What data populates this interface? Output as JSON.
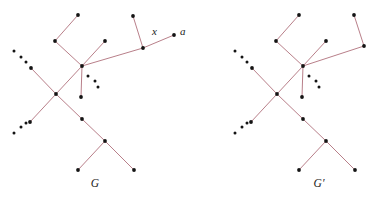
{
  "figure": {
    "width": 384,
    "height": 208,
    "background_color": "#ffffff",
    "edge_color": "#b0707c",
    "edge_width": 0.9,
    "vertex_color": "#141414",
    "vertex_radius": 1.9,
    "ellipsis_dot_color": "#141414",
    "ellipsis_dot_radius": 1.5
  },
  "panels": [
    {
      "id": "graph-g",
      "caption": "G",
      "caption_position": {
        "x": 95,
        "y": 187
      },
      "vertices": [
        {
          "id": "g-top-leaf",
          "x": 78,
          "y": 15
        },
        {
          "id": "g-upper-left-node",
          "x": 55,
          "y": 41
        },
        {
          "id": "g-right-leaf",
          "x": 105,
          "y": 41
        },
        {
          "id": "g-hub",
          "x": 82,
          "y": 66
        },
        {
          "id": "g-hub-pendant",
          "x": 81,
          "y": 97
        },
        {
          "id": "g-left-chain-end",
          "x": 31,
          "y": 68
        },
        {
          "id": "g-cross",
          "x": 56,
          "y": 94
        },
        {
          "id": "g-lower-left-end",
          "x": 30,
          "y": 122
        },
        {
          "id": "g-mid-lower",
          "x": 82,
          "y": 119
        },
        {
          "id": "g-fork",
          "x": 105,
          "y": 141
        },
        {
          "id": "g-fork-left-leaf",
          "x": 78,
          "y": 170
        },
        {
          "id": "g-fork-right-leaf",
          "x": 134,
          "y": 170
        },
        {
          "id": "g-x",
          "x": 143,
          "y": 48
        },
        {
          "id": "g-x-pendant",
          "x": 133,
          "y": 16
        },
        {
          "id": "g-a",
          "x": 174,
          "y": 35
        }
      ],
      "edges": [
        [
          "g-top-leaf",
          "g-upper-left-node"
        ],
        [
          "g-upper-left-node",
          "g-hub"
        ],
        [
          "g-right-leaf",
          "g-hub"
        ],
        [
          "g-hub",
          "g-hub-pendant"
        ],
        [
          "g-hub",
          "g-cross"
        ],
        [
          "g-left-chain-end",
          "g-cross"
        ],
        [
          "g-cross",
          "g-lower-left-end"
        ],
        [
          "g-cross",
          "g-mid-lower"
        ],
        [
          "g-mid-lower",
          "g-fork"
        ],
        [
          "g-fork",
          "g-fork-left-leaf"
        ],
        [
          "g-fork",
          "g-fork-right-leaf"
        ],
        [
          "g-hub",
          "g-x"
        ],
        [
          "g-x",
          "g-x-pendant"
        ],
        [
          "g-x",
          "g-a"
        ]
      ],
      "ellipsis_groups": [
        {
          "id": "g-ellipsis-upper-left",
          "dots": [
            [
              14,
              51
            ],
            [
              21,
              57
            ],
            [
              26,
              62
            ]
          ]
        },
        {
          "id": "g-ellipsis-lower-left",
          "dots": [
            [
              14,
              133
            ],
            [
              21,
              127
            ],
            [
              26,
              123
            ]
          ]
        },
        {
          "id": "g-ellipsis-hub-right",
          "dots": [
            [
              88,
              76
            ],
            [
              95,
              81
            ],
            [
              98,
              87
            ]
          ]
        }
      ],
      "labels": [
        {
          "id": "g-label-x",
          "text": "x",
          "x": 152,
          "y": 35
        },
        {
          "id": "g-label-a",
          "text": "a",
          "x": 180,
          "y": 35
        }
      ]
    },
    {
      "id": "graph-g-prime",
      "caption": "G′",
      "caption_position": {
        "x": 319,
        "y": 187
      },
      "vertices": [
        {
          "id": "p-top-leaf",
          "x": 299,
          "y": 15
        },
        {
          "id": "p-upper-left-node",
          "x": 276,
          "y": 41
        },
        {
          "id": "p-right-leaf",
          "x": 326,
          "y": 41
        },
        {
          "id": "p-hub",
          "x": 303,
          "y": 66
        },
        {
          "id": "p-hub-pendant",
          "x": 302,
          "y": 97
        },
        {
          "id": "p-left-chain-end",
          "x": 252,
          "y": 68
        },
        {
          "id": "p-cross",
          "x": 277,
          "y": 94
        },
        {
          "id": "p-lower-left-end",
          "x": 251,
          "y": 122
        },
        {
          "id": "p-mid-lower",
          "x": 303,
          "y": 119
        },
        {
          "id": "p-fork",
          "x": 326,
          "y": 141
        },
        {
          "id": "p-fork-left-leaf",
          "x": 299,
          "y": 170
        },
        {
          "id": "p-fork-right-leaf",
          "x": 355,
          "y": 170
        },
        {
          "id": "p-a",
          "x": 364,
          "y": 46
        },
        {
          "id": "p-a-pendant",
          "x": 354,
          "y": 15
        }
      ],
      "edges": [
        [
          "p-top-leaf",
          "p-upper-left-node"
        ],
        [
          "p-upper-left-node",
          "p-hub"
        ],
        [
          "p-right-leaf",
          "p-hub"
        ],
        [
          "p-hub",
          "p-hub-pendant"
        ],
        [
          "p-hub",
          "p-cross"
        ],
        [
          "p-left-chain-end",
          "p-cross"
        ],
        [
          "p-cross",
          "p-lower-left-end"
        ],
        [
          "p-cross",
          "p-mid-lower"
        ],
        [
          "p-mid-lower",
          "p-fork"
        ],
        [
          "p-fork",
          "p-fork-left-leaf"
        ],
        [
          "p-fork",
          "p-fork-right-leaf"
        ],
        [
          "p-hub",
          "p-a"
        ],
        [
          "p-a",
          "p-a-pendant"
        ]
      ],
      "ellipsis_groups": [
        {
          "id": "p-ellipsis-upper-left",
          "dots": [
            [
              235,
              51
            ],
            [
              242,
              57
            ],
            [
              247,
              62
            ]
          ]
        },
        {
          "id": "p-ellipsis-lower-left",
          "dots": [
            [
              235,
              133
            ],
            [
              242,
              127
            ],
            [
              247,
              123
            ]
          ]
        },
        {
          "id": "p-ellipsis-hub-right",
          "dots": [
            [
              309,
              76
            ],
            [
              316,
              81
            ],
            [
              319,
              87
            ]
          ]
        }
      ],
      "labels": []
    }
  ]
}
